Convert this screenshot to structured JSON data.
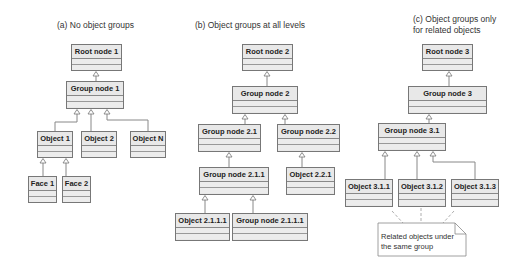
{
  "panels": [
    {
      "id": "a",
      "title": "(a) No object groups",
      "nodes": {
        "root": "Root node 1",
        "group": "Group node 1",
        "object1": "Object 1",
        "object2": "Object 2",
        "objectN": "Object N",
        "face1": "Face 1",
        "face2": "Face 2"
      }
    },
    {
      "id": "b",
      "title": "(b) Object groups at all levels",
      "nodes": {
        "root": "Root node 2",
        "group": "Group node 2",
        "group21": "Group node 2.1",
        "group22": "Group node 2.2",
        "group211": "Group node 2.1.1",
        "object221": "Object 2.2.1",
        "object2111": "Object 2.1.1.1",
        "group2111": "Group node 2.1.1.1"
      }
    },
    {
      "id": "c",
      "title_line1": "(c) Object groups only",
      "title_line2": "for related objects",
      "nodes": {
        "root": "Root node 3",
        "group": "Group node 3",
        "group31": "Group node 3.1",
        "object311": "Object 3.1.1",
        "object312": "Object 3.1.2",
        "object313": "Object 3.1.3"
      },
      "note": {
        "line1": "Related objects under",
        "line2": "the same group"
      }
    }
  ],
  "colors": {
    "node_fill": "#e8e8e8",
    "node_border": "#777777",
    "connector": "#777777",
    "text": "#222222"
  }
}
